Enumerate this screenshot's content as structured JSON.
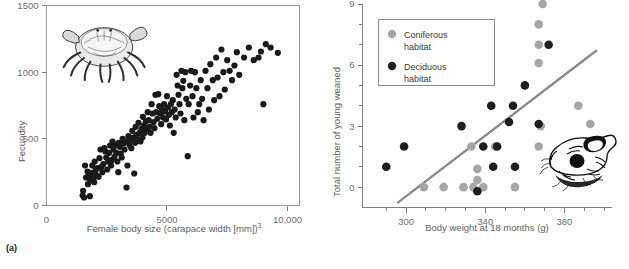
{
  "figure": {
    "panels": [
      {
        "id": "a",
        "caption": "(a)"
      },
      {
        "id": "b",
        "caption": "(b)"
      }
    ]
  },
  "chart_data": [
    {
      "type": "scatter",
      "panel": "a",
      "title": "",
      "xlabel": "Female body size (carapace width [mm])",
      "xlabel_superscript": "3",
      "ylabel": "Fecundity",
      "xlim": [
        0,
        10500
      ],
      "ylim": [
        0,
        1500
      ],
      "xticks": [
        0,
        5000,
        10000
      ],
      "xticklabels": [
        "0",
        "5000",
        "10,000"
      ],
      "yticks": [
        0,
        500,
        1000,
        1500
      ],
      "yticklabels": [
        "0",
        "500",
        "1000",
        "1500"
      ],
      "grid": false,
      "legend": null,
      "marker_color": "#1a1a1a",
      "marker_size": 3.1,
      "annotation_image": "crab-illustration",
      "points": [
        [
          1500,
          75
        ],
        [
          1520,
          110
        ],
        [
          1560,
          60
        ],
        [
          1600,
          300
        ],
        [
          1640,
          210
        ],
        [
          1700,
          255
        ],
        [
          1720,
          160
        ],
        [
          1760,
          230
        ],
        [
          1800,
          70
        ],
        [
          1820,
          190
        ],
        [
          1860,
          245
        ],
        [
          1900,
          300
        ],
        [
          1940,
          205
        ],
        [
          1980,
          175
        ],
        [
          2000,
          330
        ],
        [
          2040,
          265
        ],
        [
          2080,
          225
        ],
        [
          2120,
          280
        ],
        [
          2160,
          215
        ],
        [
          2200,
          355
        ],
        [
          2240,
          420
        ],
        [
          2280,
          290
        ],
        [
          2320,
          250
        ],
        [
          2360,
          310
        ],
        [
          2400,
          430
        ],
        [
          2440,
          405
        ],
        [
          2480,
          360
        ],
        [
          2520,
          270
        ],
        [
          2560,
          330
        ],
        [
          2600,
          395
        ],
        [
          2640,
          450
        ],
        [
          2680,
          300
        ],
        [
          2700,
          340
        ],
        [
          2740,
          480
        ],
        [
          2780,
          420
        ],
        [
          2820,
          365
        ],
        [
          2860,
          455
        ],
        [
          2900,
          395
        ],
        [
          2940,
          330
        ],
        [
          2980,
          250
        ],
        [
          3000,
          470
        ],
        [
          3040,
          440
        ],
        [
          3080,
          390
        ],
        [
          3120,
          360
        ],
        [
          3160,
          500
        ],
        [
          3200,
          465
        ],
        [
          3240,
          420
        ],
        [
          3280,
          480
        ],
        [
          3320,
          135
        ],
        [
          3360,
          300
        ],
        [
          3400,
          520
        ],
        [
          3440,
          455
        ],
        [
          3480,
          490
        ],
        [
          3520,
          430
        ],
        [
          3560,
          560
        ],
        [
          3600,
          510
        ],
        [
          3640,
          240
        ],
        [
          3680,
          470
        ],
        [
          3700,
          590
        ],
        [
          3740,
          530
        ],
        [
          3780,
          495
        ],
        [
          3820,
          620
        ],
        [
          3860,
          545
        ],
        [
          3900,
          480
        ],
        [
          3940,
          575
        ],
        [
          3980,
          510
        ],
        [
          4000,
          665
        ],
        [
          4040,
          600
        ],
        [
          4080,
          545
        ],
        [
          4120,
          630
        ],
        [
          4160,
          575
        ],
        [
          4200,
          700
        ],
        [
          4240,
          640
        ],
        [
          4280,
          590
        ],
        [
          4320,
          545
        ],
        [
          4360,
          760
        ],
        [
          4400,
          690
        ],
        [
          4440,
          625
        ],
        [
          4480,
          580
        ],
        [
          4520,
          830
        ],
        [
          4560,
          700
        ],
        [
          4600,
          650
        ],
        [
          4640,
          835
        ],
        [
          4680,
          745
        ],
        [
          4720,
          690
        ],
        [
          4760,
          610
        ],
        [
          4800,
          720
        ],
        [
          4840,
          660
        ],
        [
          4880,
          760
        ],
        [
          4920,
          705
        ],
        [
          4960,
          645
        ],
        [
          5000,
          820
        ],
        [
          5040,
          735
        ],
        [
          5080,
          680
        ],
        [
          5120,
          600
        ],
        [
          5160,
          760
        ],
        [
          5200,
          700
        ],
        [
          5240,
          790
        ],
        [
          5280,
          545
        ],
        [
          5320,
          720
        ],
        [
          5360,
          660
        ],
        [
          5400,
          980
        ],
        [
          5440,
          900
        ],
        [
          5480,
          830
        ],
        [
          5520,
          760
        ],
        [
          5560,
          690
        ],
        [
          5600,
          1010
        ],
        [
          5640,
          880
        ],
        [
          5680,
          935
        ],
        [
          5720,
          640
        ],
        [
          5760,
          1000
        ],
        [
          5800,
          800
        ],
        [
          5860,
          370
        ],
        [
          5900,
          760
        ],
        [
          5960,
          900
        ],
        [
          6000,
          1010
        ],
        [
          6060,
          820
        ],
        [
          6100,
          660
        ],
        [
          6160,
          1000
        ],
        [
          6220,
          880
        ],
        [
          6280,
          700
        ],
        [
          6340,
          760
        ],
        [
          6400,
          940
        ],
        [
          6460,
          800
        ],
        [
          6520,
          640
        ],
        [
          6600,
          1010
        ],
        [
          6680,
          880
        ],
        [
          6740,
          720
        ],
        [
          6800,
          1060
        ],
        [
          6900,
          940
        ],
        [
          6960,
          790
        ],
        [
          7040,
          1110
        ],
        [
          7100,
          960
        ],
        [
          7180,
          820
        ],
        [
          7260,
          1170
        ],
        [
          7340,
          1000
        ],
        [
          7400,
          870
        ],
        [
          7500,
          1090
        ],
        [
          7600,
          1010
        ],
        [
          7700,
          940
        ],
        [
          7800,
          1050
        ],
        [
          7900,
          1150
        ],
        [
          8000,
          980
        ],
        [
          8200,
          1110
        ],
        [
          8400,
          1185
        ],
        [
          8600,
          1090
        ],
        [
          8800,
          1110
        ],
        [
          8900,
          1155
        ],
        [
          9000,
          760
        ],
        [
          9100,
          1210
        ],
        [
          9300,
          1185
        ],
        [
          9600,
          1145
        ]
      ]
    },
    {
      "type": "scatter",
      "panel": "b",
      "title": "",
      "xlabel": "Body weight at 18 months (g)",
      "ylabel": "Total number of young weaned",
      "xlim": [
        278,
        404
      ],
      "ylim": [
        -1,
        9
      ],
      "xticks": [
        300,
        340,
        380
      ],
      "xticklabels": [
        "300",
        "340",
        "380"
      ],
      "xminorticks": [
        290,
        310,
        320,
        330,
        350,
        360,
        370,
        390,
        400
      ],
      "yticks": [
        0,
        3,
        6,
        9
      ],
      "yticklabels": [
        "0",
        "3",
        "6",
        "9"
      ],
      "yminorticks": [
        1,
        2,
        4,
        5,
        7,
        8
      ],
      "grid": false,
      "legend": {
        "position": "top-left",
        "entries": [
          {
            "label": "Coniferous habitat",
            "color": "#a6a6a6"
          },
          {
            "label": "Deciduous habitat",
            "color": "#1f1f1f"
          }
        ]
      },
      "trendline": {
        "color": "#8a8a8a",
        "x_start": 296,
        "y_start": -0.75,
        "x_end": 396,
        "y_end": 6.7
      },
      "annotation_image": "squirrel-illustration",
      "marker_size": 4.3,
      "series": [
        {
          "name": "Coniferous habitat",
          "color": "#a6a6a6",
          "points": [
            [
              309,
              0
            ],
            [
              319,
              0
            ],
            [
              329,
              0
            ],
            [
              333,
              2
            ],
            [
              334,
              0
            ],
            [
              336,
              0.35
            ],
            [
              336,
              0.9
            ],
            [
              339,
              0
            ],
            [
              345,
              2
            ],
            [
              355,
              0
            ],
            [
              367,
              8
            ],
            [
              367,
              7
            ],
            [
              367,
              6.1
            ],
            [
              367,
              2
            ],
            [
              368,
              3
            ],
            [
              369,
              9
            ],
            [
              387,
              4
            ],
            [
              393,
              3.1
            ]
          ]
        },
        {
          "name": "Deciduous habitat",
          "color": "#1f1f1f",
          "points": [
            [
              290,
              1
            ],
            [
              299,
              2
            ],
            [
              328,
              3
            ],
            [
              336,
              -0.2
            ],
            [
              339,
              2
            ],
            [
              343,
              4
            ],
            [
              344,
              1
            ],
            [
              346,
              2
            ],
            [
              352,
              3.2
            ],
            [
              354,
              4
            ],
            [
              355,
              1
            ],
            [
              360,
              5
            ],
            [
              367,
              3.1
            ],
            [
              372,
              7
            ]
          ]
        }
      ]
    }
  ]
}
